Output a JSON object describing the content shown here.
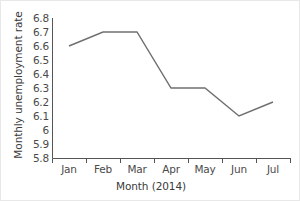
{
  "chart_data": {
    "type": "line",
    "title": "",
    "xlabel": "Month (2014)",
    "ylabel": "Monthly unemployment rate",
    "categories": [
      "Jan",
      "Feb",
      "Mar",
      "Apr",
      "May",
      "Jun",
      "Jul"
    ],
    "values": [
      6.6,
      6.7,
      6.7,
      6.3,
      6.3,
      6.1,
      6.2
    ],
    "series": [
      {
        "name": "Monthly unemployment rate",
        "values": [
          6.6,
          6.7,
          6.7,
          6.3,
          6.3,
          6.1,
          6.2
        ]
      }
    ],
    "ylim": [
      5.8,
      6.8
    ],
    "yticks": [
      6.8,
      6.7,
      6.6,
      6.5,
      6.4,
      6.3,
      6.2,
      6.1,
      6,
      5.9,
      5.8
    ],
    "ytick_labels": [
      "6.8",
      "6.7",
      "6.6",
      "6.5",
      "6.4",
      "6.3",
      "6.2",
      "6.1",
      "6",
      "5.9",
      "5.8"
    ],
    "xtick_labels": [
      "Jan",
      "Feb",
      "Mar",
      "Apr",
      "May",
      "Jun",
      "Jul"
    ],
    "grid": false,
    "legend": "none",
    "line_color": "#6f6f6f",
    "axis_color": "#555555",
    "text_color": "#3f3f3f",
    "background_color": "#ffffff",
    "border_color": "#e8e8e8"
  }
}
